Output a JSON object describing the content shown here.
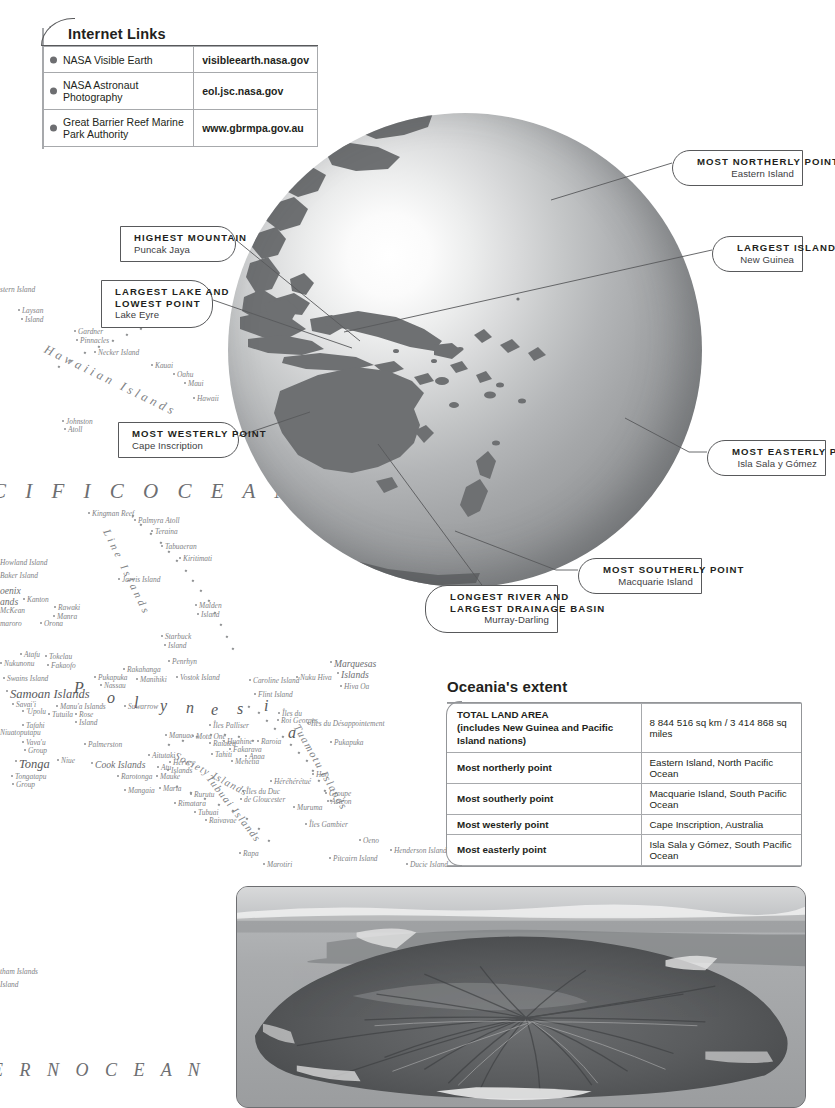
{
  "internet_links": {
    "title": "Internet Links",
    "rows": [
      {
        "name": "NASA Visible Earth",
        "url": "visibleearth.nasa.gov"
      },
      {
        "name": "NASA Astronaut Photography",
        "url": "eol.jsc.nasa.gov"
      },
      {
        "name": "Great Barrier Reef Marine Park Authority",
        "url": "www.gbrmpa.gov.au"
      }
    ]
  },
  "callouts": {
    "highest_mountain": {
      "title": "HIGHEST MOUNTAIN",
      "sub": "Puncak Jaya"
    },
    "largest_lake": {
      "title": "LARGEST LAKE  AND",
      "title2": "LOWEST POINT",
      "sub": "Lake Eyre"
    },
    "most_westerly": {
      "title": "MOST WESTERLY POINT",
      "sub": "Cape Inscription"
    },
    "most_northerly": {
      "title": "MOST NORTHERLY POINT",
      "sub": "Eastern Island"
    },
    "largest_island": {
      "title": "LARGEST ISLAND",
      "sub": "New Guinea"
    },
    "most_easterly": {
      "title": "MOST EASTERLY POINT",
      "sub": "Isla Sala y Gómez"
    },
    "most_southerly": {
      "title": "MOST SOUTHERLY POINT",
      "sub": "Macquarie Island"
    },
    "longest_river": {
      "title": "LONGEST RIVER AND",
      "title2": "LARGEST DRAINAGE BASIN",
      "sub": "Murray-Darling"
    }
  },
  "oceania_extent": {
    "heading": "Oceania's extent",
    "rows": [
      {
        "key": "TOTAL LAND AREA",
        "key2": "(includes New Guinea and Pacific Island nations)",
        "value": "8 844 516 sq km / 3 414 868 sq miles"
      },
      {
        "key": "Most northerly point",
        "value": "Eastern Island, North Pacific Ocean"
      },
      {
        "key": "Most southerly point",
        "value": "Macquarie Island, South Pacific Ocean"
      },
      {
        "key": "Most westerly point",
        "value": "Cape Inscription, Australia"
      },
      {
        "key": "Most easterly point",
        "value": "Isla Sala y Gómez, South Pacific Ocean"
      }
    ]
  },
  "map": {
    "ocean_label": "C I F I C   O C E A N",
    "ocean_label_bottom": "E R N   O C E A N",
    "region_polynesia_letters": [
      "P",
      "o",
      "l",
      "y",
      "n",
      "e",
      "s",
      "i",
      "a"
    ],
    "labels": [
      {
        "t": "stern Island",
        "x": 0,
        "y": 285,
        "cls": "isle"
      },
      {
        "t": "Laysan",
        "x": 22,
        "y": 306,
        "cls": "isle"
      },
      {
        "t": "Island",
        "x": 25,
        "y": 315,
        "cls": "isle"
      },
      {
        "t": "Gardner",
        "x": 78,
        "y": 327,
        "cls": "isle"
      },
      {
        "t": "Pinnacles",
        "x": 80,
        "y": 336,
        "cls": "isle"
      },
      {
        "t": "Necker Island",
        "x": 98,
        "y": 348,
        "cls": "isle"
      },
      {
        "t": "Kauai",
        "x": 155,
        "y": 361,
        "cls": "isle"
      },
      {
        "t": "Oahu",
        "x": 177,
        "y": 370,
        "cls": "isle"
      },
      {
        "t": "Maui",
        "x": 188,
        "y": 379,
        "cls": "isle"
      },
      {
        "t": "Hawaii",
        "x": 197,
        "y": 394,
        "cls": "isle"
      },
      {
        "t": "Johnston",
        "x": 66,
        "y": 417,
        "cls": "isle"
      },
      {
        "t": "Atoll",
        "x": 68,
        "y": 425,
        "cls": "isle"
      },
      {
        "t": "Kingman Reef",
        "x": 92,
        "y": 509,
        "cls": "isle"
      },
      {
        "t": "Palmyra Atoll",
        "x": 138,
        "y": 516,
        "cls": "isle"
      },
      {
        "t": "Teraina",
        "x": 155,
        "y": 527,
        "cls": "isle"
      },
      {
        "t": "Tabuaeran",
        "x": 165,
        "y": 542,
        "cls": "isle"
      },
      {
        "t": "Kiritimati",
        "x": 183,
        "y": 554,
        "cls": "isle"
      },
      {
        "t": "Howland Island",
        "x": 0,
        "y": 558,
        "cls": "isle"
      },
      {
        "t": "Baker Island",
        "x": 0,
        "y": 571,
        "cls": "isle"
      },
      {
        "t": "Jarvis Island",
        "x": 122,
        "y": 575,
        "cls": "isle"
      },
      {
        "t": "oenix",
        "x": 0,
        "y": 585,
        "cls": "group"
      },
      {
        "t": "ands",
        "x": 0,
        "y": 596,
        "cls": "group"
      },
      {
        "t": "Kanton",
        "x": 27,
        "y": 595,
        "cls": "isle"
      },
      {
        "t": "McKean",
        "x": 0,
        "y": 606,
        "cls": "isle"
      },
      {
        "t": "Rawaki",
        "x": 58,
        "y": 603,
        "cls": "isle"
      },
      {
        "t": "Manra",
        "x": 57,
        "y": 612,
        "cls": "isle"
      },
      {
        "t": "Orona",
        "x": 44,
        "y": 619,
        "cls": "isle"
      },
      {
        "t": "maroro",
        "x": 0,
        "y": 619,
        "cls": "isle"
      },
      {
        "t": "Malden",
        "x": 199,
        "y": 601,
        "cls": "isle"
      },
      {
        "t": "Island",
        "x": 201,
        "y": 610,
        "cls": "isle"
      },
      {
        "t": "Starbuck",
        "x": 165,
        "y": 632,
        "cls": "isle"
      },
      {
        "t": "Island",
        "x": 168,
        "y": 641,
        "cls": "isle"
      },
      {
        "t": "Atafu",
        "x": 24,
        "y": 650,
        "cls": "isle"
      },
      {
        "t": "Tokelau",
        "x": 49,
        "y": 652,
        "cls": "isle"
      },
      {
        "t": "Nukunonu",
        "x": 4,
        "y": 659,
        "cls": "isle"
      },
      {
        "t": "Fakaofo",
        "x": 51,
        "y": 661,
        "cls": "isle"
      },
      {
        "t": "Penrhyn",
        "x": 172,
        "y": 657,
        "cls": "isle"
      },
      {
        "t": "Rakahanga",
        "x": 127,
        "y": 665,
        "cls": "isle"
      },
      {
        "t": "Pukapuka",
        "x": 98,
        "y": 673,
        "cls": "isle"
      },
      {
        "t": "Manihiki",
        "x": 140,
        "y": 675,
        "cls": "isle"
      },
      {
        "t": "Nassau",
        "x": 104,
        "y": 681,
        "cls": "isle"
      },
      {
        "t": "Vostok Island",
        "x": 180,
        "y": 673,
        "cls": "isle"
      },
      {
        "t": "Swains Island",
        "x": 7,
        "y": 674,
        "cls": "isle"
      },
      {
        "t": "Samoan Islands",
        "x": 10,
        "y": 687,
        "cls": "groupbig"
      },
      {
        "t": "Savai'i",
        "x": 16,
        "y": 700,
        "cls": "isle"
      },
      {
        "t": "'Upolu",
        "x": 26,
        "y": 707,
        "cls": "isle"
      },
      {
        "t": "Manu'a Islands",
        "x": 60,
        "y": 702,
        "cls": "isle"
      },
      {
        "t": "Tutuila",
        "x": 52,
        "y": 710,
        "cls": "isle"
      },
      {
        "t": "Rose",
        "x": 79,
        "y": 710,
        "cls": "isle"
      },
      {
        "t": "Island",
        "x": 79,
        "y": 718,
        "cls": "isle"
      },
      {
        "t": "Suwarrow",
        "x": 128,
        "y": 702,
        "cls": "isle"
      },
      {
        "t": "Tafahi",
        "x": 26,
        "y": 721,
        "cls": "isle"
      },
      {
        "t": "Niuatoputapu",
        "x": 0,
        "y": 728,
        "cls": "isle"
      },
      {
        "t": "Vava'u",
        "x": 26,
        "y": 738,
        "cls": "isle"
      },
      {
        "t": "Group",
        "x": 28,
        "y": 746,
        "cls": "isle"
      },
      {
        "t": "Palmerston",
        "x": 88,
        "y": 740,
        "cls": "isle"
      },
      {
        "t": "Niue",
        "x": 61,
        "y": 756,
        "cls": "isle"
      },
      {
        "t": "Tonga",
        "x": 19,
        "y": 757,
        "cls": "groupbig"
      },
      {
        "t": "Cook Islands",
        "x": 95,
        "y": 759,
        "cls": "group"
      },
      {
        "t": "Tongatapu",
        "x": 15,
        "y": 772,
        "cls": "isle"
      },
      {
        "t": "Group",
        "x": 16,
        "y": 780,
        "cls": "isle"
      },
      {
        "t": "Aitutaki",
        "x": 152,
        "y": 751,
        "cls": "isle"
      },
      {
        "t": "Hervey",
        "x": 173,
        "y": 758,
        "cls": "isle"
      },
      {
        "t": "Islands",
        "x": 171,
        "y": 766,
        "cls": "isle"
      },
      {
        "t": "Atu",
        "x": 161,
        "y": 763,
        "cls": "isle"
      },
      {
        "t": "Mauke",
        "x": 160,
        "y": 772,
        "cls": "isle"
      },
      {
        "t": "Maria",
        "x": 163,
        "y": 784,
        "cls": "isle"
      },
      {
        "t": "Rarotonga",
        "x": 121,
        "y": 772,
        "cls": "isle"
      },
      {
        "t": "Mangaia",
        "x": 128,
        "y": 786,
        "cls": "isle"
      },
      {
        "t": "Manuae",
        "x": 169,
        "y": 731,
        "cls": "isle"
      },
      {
        "t": "Motu One",
        "x": 196,
        "y": 732,
        "cls": "isle"
      },
      {
        "t": "Raiatea",
        "x": 213,
        "y": 739,
        "cls": "isle"
      },
      {
        "t": "Huahine",
        "x": 227,
        "y": 737,
        "cls": "isle"
      },
      {
        "t": "Fakarava",
        "x": 233,
        "y": 745,
        "cls": "isle"
      },
      {
        "t": "Tahiti",
        "x": 215,
        "y": 750,
        "cls": "isle"
      },
      {
        "t": "Mehetia",
        "x": 235,
        "y": 757,
        "cls": "isle"
      },
      {
        "t": "Anaa",
        "x": 249,
        "y": 752,
        "cls": "isle"
      },
      {
        "t": "Raroia",
        "x": 261,
        "y": 737,
        "cls": "isle"
      },
      {
        "t": "Îles du",
        "x": 282,
        "y": 709,
        "cls": "isle"
      },
      {
        "t": "Roi Georges",
        "x": 281,
        "y": 716,
        "cls": "isle"
      },
      {
        "t": "Îles du Désappointement",
        "x": 311,
        "y": 719,
        "cls": "isle"
      },
      {
        "t": "Pukapuka",
        "x": 334,
        "y": 738,
        "cls": "isle"
      },
      {
        "t": "Îles Palliser",
        "x": 213,
        "y": 721,
        "cls": "isle"
      },
      {
        "t": "Hao",
        "x": 316,
        "y": 770,
        "cls": "isle"
      },
      {
        "t": "Héréhérétué",
        "x": 274,
        "y": 777,
        "cls": "isle"
      },
      {
        "t": "Groupe",
        "x": 329,
        "y": 789,
        "cls": "isle"
      },
      {
        "t": "Actéon",
        "x": 331,
        "y": 797,
        "cls": "isle"
      },
      {
        "t": "Îles du Duc",
        "x": 246,
        "y": 787,
        "cls": "isle"
      },
      {
        "t": "de Gloucester",
        "x": 244,
        "y": 795,
        "cls": "isle"
      },
      {
        "t": "Muruma",
        "x": 297,
        "y": 803,
        "cls": "isle"
      },
      {
        "t": "Rurutu",
        "x": 194,
        "y": 790,
        "cls": "isle"
      },
      {
        "t": "Rimatara",
        "x": 178,
        "y": 799,
        "cls": "isle"
      },
      {
        "t": "Tubuai",
        "x": 198,
        "y": 808,
        "cls": "isle"
      },
      {
        "t": "Raivavae",
        "x": 209,
        "y": 816,
        "cls": "isle"
      },
      {
        "t": "Îles Gambier",
        "x": 309,
        "y": 820,
        "cls": "isle"
      },
      {
        "t": "Oeno",
        "x": 363,
        "y": 836,
        "cls": "isle"
      },
      {
        "t": "Henderson Island",
        "x": 394,
        "y": 846,
        "cls": "isle"
      },
      {
        "t": "Pitcairn Island",
        "x": 333,
        "y": 854,
        "cls": "isle"
      },
      {
        "t": "Ducie Island",
        "x": 410,
        "y": 860,
        "cls": "isle"
      },
      {
        "t": "Rapa",
        "x": 243,
        "y": 849,
        "cls": "isle"
      },
      {
        "t": "Marotiri",
        "x": 267,
        "y": 860,
        "cls": "isle"
      },
      {
        "t": "Caroline Island",
        "x": 253,
        "y": 676,
        "cls": "isle"
      },
      {
        "t": "Flint Island",
        "x": 258,
        "y": 690,
        "cls": "isle"
      },
      {
        "t": "Nuku Hiva",
        "x": 300,
        "y": 673,
        "cls": "isle"
      },
      {
        "t": "Marquesas",
        "x": 334,
        "y": 658,
        "cls": "group"
      },
      {
        "t": "Islands",
        "x": 341,
        "y": 669,
        "cls": "group"
      },
      {
        "t": "Hiva Oa",
        "x": 344,
        "y": 682,
        "cls": "isle"
      },
      {
        "t": "tham Islands",
        "x": 0,
        "y": 967,
        "cls": "isle"
      },
      {
        "t": "Island",
        "x": 0,
        "y": 980,
        "cls": "isle"
      }
    ],
    "arc_words": [
      {
        "t": "Hawaiian Islands",
        "x": 48,
        "y": 342,
        "rot": 26,
        "size": 12.5,
        "spacing": 3.6
      },
      {
        "t": "Line Islands",
        "x": 112,
        "y": 527,
        "rot": 64,
        "size": 11,
        "spacing": 3.4
      },
      {
        "t": "Tuamotu Islands",
        "x": 302,
        "y": 722,
        "rot": 60,
        "size": 11,
        "spacing": 1.6
      },
      {
        "t": "Society Islands",
        "x": 178,
        "y": 750,
        "rot": 28,
        "size": 10.5,
        "spacing": 1.2
      },
      {
        "t": "Tubuai Islands",
        "x": 213,
        "y": 773,
        "rot": 52,
        "size": 10.5,
        "spacing": 1.4
      }
    ]
  }
}
